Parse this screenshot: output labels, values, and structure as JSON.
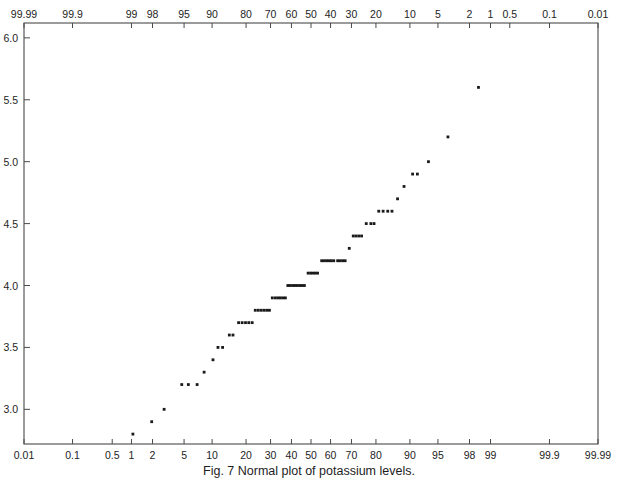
{
  "caption": "Fig. 7 Normal plot of potassium levels.",
  "colors": {
    "axis": "#4a4a4a",
    "point": "#1a1a1a",
    "background": "#ffffff",
    "text": "#1d1d1d"
  },
  "axes": {
    "top": {
      "name": "top-probability-axis",
      "orientation": "reversed",
      "labels": [
        "99.99",
        "99.9",
        "99",
        "98",
        "95",
        "90",
        "80",
        "70",
        "60",
        "50",
        "40",
        "30",
        "20",
        "10",
        "5",
        "2",
        "1",
        "0.5",
        "0.1",
        "0.01"
      ]
    },
    "bottom": {
      "name": "bottom-probability-axis",
      "orientation": "normal",
      "labels": [
        "0.01",
        "0.1",
        "0.5",
        "1",
        "2",
        "5",
        "10",
        "20",
        "30",
        "40",
        "50",
        "60",
        "70",
        "80",
        "90",
        "95",
        "98",
        "99",
        "99.9",
        "99.99"
      ]
    },
    "left": {
      "name": "left-value-axis",
      "labels": [
        "3.0",
        "3.5",
        "4.0",
        "4.5",
        "5.0",
        "5.5",
        "6.0"
      ],
      "min": 2.72,
      "max": 6.12
    }
  },
  "chart_data": {
    "type": "scatter",
    "title": "Fig. 7 Normal plot of potassium levels.",
    "xlabel": "Cumulative probability (%)",
    "ylabel": "Potassium level",
    "xscale": "probit",
    "grid": false,
    "legend": null,
    "xlim": [
      0.01,
      99.99
    ],
    "ylim": [
      2.72,
      6.12
    ],
    "xticks": [
      0.01,
      0.1,
      0.5,
      1,
      2,
      5,
      10,
      20,
      30,
      40,
      50,
      60,
      70,
      80,
      90,
      95,
      98,
      99,
      99.9,
      99.99
    ],
    "yticks": [
      3.0,
      3.5,
      4.0,
      4.5,
      5.0,
      5.5,
      6.0
    ],
    "top_axis_ticks": [
      99.99,
      99.9,
      99,
      98,
      95,
      90,
      80,
      70,
      60,
      50,
      40,
      30,
      20,
      10,
      5,
      2,
      1,
      0.5,
      0.1,
      0.01
    ],
    "points": [
      {
        "p": 1.05,
        "y": 2.8
      },
      {
        "p": 1.95,
        "y": 2.9
      },
      {
        "p": 2.85,
        "y": 3.0
      },
      {
        "p": 4.7,
        "y": 3.2
      },
      {
        "p": 5.6,
        "y": 3.2
      },
      {
        "p": 7.0,
        "y": 3.2
      },
      {
        "p": 8.3,
        "y": 3.3
      },
      {
        "p": 10.2,
        "y": 3.4
      },
      {
        "p": 11.4,
        "y": 3.5
      },
      {
        "p": 12.6,
        "y": 3.5
      },
      {
        "p": 14.5,
        "y": 3.6
      },
      {
        "p": 15.6,
        "y": 3.6
      },
      {
        "p": 17.4,
        "y": 3.7
      },
      {
        "p": 18.6,
        "y": 3.7
      },
      {
        "p": 19.8,
        "y": 3.7
      },
      {
        "p": 21.0,
        "y": 3.7
      },
      {
        "p": 22.3,
        "y": 3.7
      },
      {
        "p": 23.5,
        "y": 3.8
      },
      {
        "p": 24.7,
        "y": 3.8
      },
      {
        "p": 25.9,
        "y": 3.8
      },
      {
        "p": 27.1,
        "y": 3.8
      },
      {
        "p": 28.3,
        "y": 3.8
      },
      {
        "p": 29.5,
        "y": 3.8
      },
      {
        "p": 30.8,
        "y": 3.9
      },
      {
        "p": 32.2,
        "y": 3.9
      },
      {
        "p": 33.4,
        "y": 3.9
      },
      {
        "p": 34.6,
        "y": 3.9
      },
      {
        "p": 35.8,
        "y": 3.9
      },
      {
        "p": 37.0,
        "y": 3.9
      },
      {
        "p": 38.2,
        "y": 4.0
      },
      {
        "p": 39.4,
        "y": 4.0
      },
      {
        "p": 40.6,
        "y": 4.0
      },
      {
        "p": 41.8,
        "y": 4.0
      },
      {
        "p": 43.0,
        "y": 4.0
      },
      {
        "p": 44.2,
        "y": 4.0
      },
      {
        "p": 45.4,
        "y": 4.0
      },
      {
        "p": 46.6,
        "y": 4.0
      },
      {
        "p": 48.5,
        "y": 4.1
      },
      {
        "p": 49.8,
        "y": 4.1
      },
      {
        "p": 51.0,
        "y": 4.1
      },
      {
        "p": 52.2,
        "y": 4.1
      },
      {
        "p": 53.4,
        "y": 4.1
      },
      {
        "p": 55.5,
        "y": 4.2
      },
      {
        "p": 56.8,
        "y": 4.2
      },
      {
        "p": 58.0,
        "y": 4.2
      },
      {
        "p": 59.2,
        "y": 4.2
      },
      {
        "p": 60.4,
        "y": 4.2
      },
      {
        "p": 61.6,
        "y": 4.2
      },
      {
        "p": 63.5,
        "y": 4.2
      },
      {
        "p": 64.7,
        "y": 4.2
      },
      {
        "p": 65.9,
        "y": 4.2
      },
      {
        "p": 67.1,
        "y": 4.2
      },
      {
        "p": 69.0,
        "y": 4.3
      },
      {
        "p": 70.8,
        "y": 4.4
      },
      {
        "p": 72.0,
        "y": 4.4
      },
      {
        "p": 73.2,
        "y": 4.4
      },
      {
        "p": 74.4,
        "y": 4.4
      },
      {
        "p": 76.3,
        "y": 4.5
      },
      {
        "p": 78.1,
        "y": 4.5
      },
      {
        "p": 79.3,
        "y": 4.5
      },
      {
        "p": 81.0,
        "y": 4.6
      },
      {
        "p": 82.5,
        "y": 4.6
      },
      {
        "p": 84.0,
        "y": 4.6
      },
      {
        "p": 85.3,
        "y": 4.6
      },
      {
        "p": 86.9,
        "y": 4.7
      },
      {
        "p": 88.6,
        "y": 4.8
      },
      {
        "p": 90.6,
        "y": 4.9
      },
      {
        "p": 91.6,
        "y": 4.9
      },
      {
        "p": 93.6,
        "y": 5.0
      },
      {
        "p": 96.2,
        "y": 5.2
      },
      {
        "p": 98.5,
        "y": 5.6
      }
    ]
  }
}
